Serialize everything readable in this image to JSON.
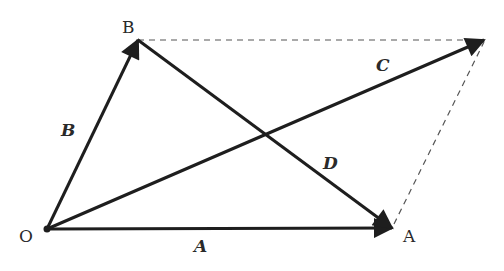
{
  "diagram": {
    "title": "",
    "colors": {
      "stroke": "#1e1e1e",
      "dashed": "#555555",
      "label": "#2a2a2a",
      "background": "#ffffff"
    },
    "points": [
      {
        "id": "O",
        "label": "O",
        "x": 47,
        "y": 229
      },
      {
        "id": "B",
        "label": "B",
        "x": 138,
        "y": 40
      },
      {
        "id": "A",
        "label": "A",
        "x": 392,
        "y": 228
      },
      {
        "id": "Ctip",
        "label": "",
        "x": 484,
        "y": 40
      }
    ],
    "vectors": [
      {
        "id": "A",
        "label": "A",
        "from": "O",
        "to": "A"
      },
      {
        "id": "B",
        "label": "B",
        "from": "O",
        "to": "B"
      },
      {
        "id": "C",
        "label": "C",
        "from": "O",
        "to": "Ctip"
      },
      {
        "id": "D",
        "label": "D",
        "from": "B",
        "to": "A"
      }
    ],
    "dashed_lines": [
      {
        "from": "B",
        "to": "Ctip"
      },
      {
        "from": "A",
        "to": "Ctip"
      }
    ],
    "labels": {
      "point_O": "O",
      "point_B": "B",
      "point_A": "A",
      "vec_A": "A",
      "vec_B": "B",
      "vec_C": "C",
      "vec_D": "D"
    }
  }
}
